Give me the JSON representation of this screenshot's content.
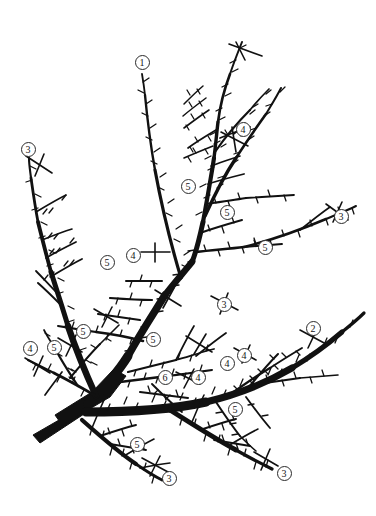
{
  "figure": {
    "width": 376,
    "height": 516,
    "background_color": "#ffffff",
    "ink_color": "#111111",
    "label_ring_color": "#2b2b2b",
    "label_text_color": "#151515",
    "legend_note": "",
    "axis_note": ""
  },
  "chart_data": {
    "type": "diagram",
    "title": "",
    "subtitle": "",
    "xlabel": "",
    "ylabel": "",
    "grid": false,
    "legend": "none",
    "label_values": [
      "1",
      "2",
      "3",
      "3",
      "3",
      "3",
      "3",
      "4",
      "4",
      "4",
      "4",
      "4",
      "4",
      "5",
      "5",
      "5",
      "5",
      "5",
      "5",
      "5",
      "5",
      "5",
      "5",
      "6"
    ],
    "label_counts": {
      "1": 1,
      "2": 1,
      "3": 5,
      "4": 6,
      "5": 10,
      "6": 1
    }
  },
  "labels": [
    {
      "id": "label-1-top-center",
      "text": "1",
      "x": 142,
      "y": 62
    },
    {
      "id": "label-4-upper-right",
      "text": "4",
      "x": 243,
      "y": 129
    },
    {
      "id": "label-3-upper-left",
      "text": "3",
      "x": 28,
      "y": 149
    },
    {
      "id": "label-5-mid-center",
      "text": "5",
      "x": 188,
      "y": 186
    },
    {
      "id": "label-5-mid-right",
      "text": "5",
      "x": 227,
      "y": 212
    },
    {
      "id": "label-3-mid-far-right",
      "text": "3",
      "x": 341,
      "y": 216
    },
    {
      "id": "label-5-right-of-center",
      "text": "5",
      "x": 265,
      "y": 247
    },
    {
      "id": "label-4-center-left",
      "text": "4",
      "x": 133,
      "y": 255
    },
    {
      "id": "label-5-center-left",
      "text": "5",
      "x": 107,
      "y": 262
    },
    {
      "id": "label-3-center-right",
      "text": "3",
      "x": 224,
      "y": 304
    },
    {
      "id": "label-2-right",
      "text": "2",
      "x": 313,
      "y": 328
    },
    {
      "id": "label-5-left-upper",
      "text": "5",
      "x": 83,
      "y": 331
    },
    {
      "id": "label-5-mid-left-cluster",
      "text": "5",
      "x": 153,
      "y": 339
    },
    {
      "id": "label-4-far-left",
      "text": "4",
      "x": 30,
      "y": 348
    },
    {
      "id": "label-5-far-left",
      "text": "5",
      "x": 54,
      "y": 347
    },
    {
      "id": "label-4-right-pair-b",
      "text": "4",
      "x": 244,
      "y": 355
    },
    {
      "id": "label-4-right-pair-a",
      "text": "4",
      "x": 227,
      "y": 363
    },
    {
      "id": "label-6-center",
      "text": "6",
      "x": 165,
      "y": 377
    },
    {
      "id": "label-4-center-lower",
      "text": "4",
      "x": 198,
      "y": 377
    },
    {
      "id": "label-5-lower-right",
      "text": "5",
      "x": 235,
      "y": 409
    },
    {
      "id": "label-5-lower-left",
      "text": "5",
      "x": 137,
      "y": 444
    },
    {
      "id": "label-3-bottom-left",
      "text": "3",
      "x": 169,
      "y": 478
    },
    {
      "id": "label-3-bottom-right",
      "text": "3",
      "x": 284,
      "y": 473
    }
  ]
}
